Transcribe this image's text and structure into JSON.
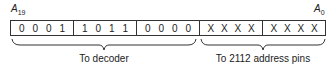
{
  "labels": {
    "msb": {
      "letter": "A",
      "sub": "19"
    },
    "lsb": {
      "letter": "A",
      "sub": "0"
    }
  },
  "nibbles": [
    [
      "0",
      "0",
      "0",
      "1"
    ],
    [
      "1",
      "0",
      "1",
      "1"
    ],
    [
      "0",
      "0",
      "0",
      "0"
    ],
    [
      "X",
      "X",
      "X",
      "X"
    ],
    [
      "X",
      "X",
      "X",
      "X"
    ]
  ],
  "captions": {
    "decoder": "To decoder",
    "pins": "To 2112 address pins"
  }
}
